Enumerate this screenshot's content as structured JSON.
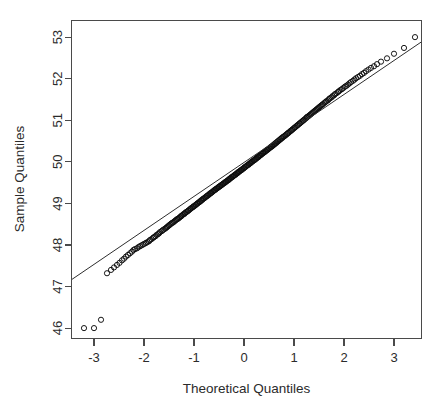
{
  "figure": {
    "title": "",
    "width": 441,
    "height": 409,
    "background": "#ffffff"
  },
  "axis_titles": {
    "x": "Theoretical Quantiles",
    "y": "Sample Quantiles"
  },
  "colors": {
    "point_stroke": "#0d0d0d",
    "line": "#2e2e2e",
    "axis": "#4a4a4a",
    "text": "#2b2b2b"
  },
  "chart_data": {
    "type": "scatter",
    "title": "",
    "xlabel": "Theoretical Quantiles",
    "ylabel": "Sample Quantiles",
    "xlim": [
      -3.45,
      3.55
    ],
    "ylim": [
      45.75,
      53.4
    ],
    "xticks": [
      -3,
      -2,
      -1,
      0,
      1,
      2,
      3
    ],
    "xtick_labels": [
      "-3",
      "-2",
      "-1",
      "0",
      "1",
      "2",
      "3"
    ],
    "yticks": [
      46,
      47,
      48,
      49,
      50,
      51,
      52,
      53
    ],
    "ytick_labels": [
      "46",
      "47",
      "48",
      "49",
      "50",
      "51",
      "52",
      "53"
    ],
    "grid": false,
    "legend": null,
    "marker": "open-circle",
    "marker_size_px": 2.6,
    "reference_line": {
      "description": "qqline through first and third quartiles",
      "slope": 0.8175,
      "intercept": 49.985,
      "x_start": -3.45,
      "x_end": 3.55,
      "y_start": 47.165,
      "y_end": 52.887
    },
    "series": [
      {
        "name": "Sample Quantiles",
        "points": [
          [
            -3.2,
            46.0
          ],
          [
            -3.0,
            46.0
          ],
          [
            -2.86,
            46.2
          ],
          [
            -2.74,
            47.32
          ],
          [
            -2.66,
            47.4
          ],
          [
            -2.6,
            47.46
          ],
          [
            -2.54,
            47.52
          ],
          [
            -2.49,
            47.57
          ],
          [
            -2.44,
            47.63
          ],
          [
            -2.4,
            47.67
          ],
          [
            -2.36,
            47.72
          ],
          [
            -2.32,
            47.76
          ],
          [
            -2.28,
            47.8
          ],
          [
            -2.24,
            47.84
          ],
          [
            -2.21,
            47.88
          ],
          [
            -2.18,
            47.9
          ],
          [
            -2.14,
            47.92
          ],
          [
            -2.11,
            47.95
          ],
          [
            -2.08,
            47.97
          ],
          [
            -2.05,
            47.99
          ],
          [
            -2.02,
            48.01
          ],
          [
            -1.99,
            48.03
          ],
          [
            -1.96,
            48.05
          ],
          [
            -1.93,
            48.07
          ],
          [
            -1.9,
            48.09
          ],
          [
            -1.88,
            48.12
          ],
          [
            -1.85,
            48.14
          ],
          [
            -1.82,
            48.17
          ],
          [
            -1.8,
            48.19
          ],
          [
            -1.77,
            48.21
          ],
          [
            -1.75,
            48.24
          ],
          [
            -1.72,
            48.26
          ],
          [
            -1.7,
            48.28
          ],
          [
            -1.68,
            48.31
          ],
          [
            -1.65,
            48.33
          ],
          [
            -1.63,
            48.35
          ],
          [
            -1.61,
            48.37
          ],
          [
            -1.58,
            48.39
          ],
          [
            -1.56,
            48.41
          ],
          [
            -1.54,
            48.43
          ],
          [
            -1.52,
            48.45
          ],
          [
            -1.5,
            48.47
          ],
          [
            -1.48,
            48.49
          ],
          [
            -1.46,
            48.51
          ],
          [
            -1.44,
            48.53
          ],
          [
            -1.42,
            48.54
          ],
          [
            -1.4,
            48.56
          ],
          [
            -1.38,
            48.58
          ],
          [
            -1.36,
            48.6
          ],
          [
            -1.34,
            48.62
          ],
          [
            -1.32,
            48.63
          ],
          [
            -1.3,
            48.65
          ],
          [
            -1.28,
            48.67
          ],
          [
            -1.26,
            48.69
          ],
          [
            -1.25,
            48.7
          ],
          [
            -1.23,
            48.72
          ],
          [
            -1.21,
            48.74
          ],
          [
            -1.19,
            48.75
          ],
          [
            -1.18,
            48.77
          ],
          [
            -1.16,
            48.79
          ],
          [
            -1.14,
            48.8
          ],
          [
            -1.12,
            48.82
          ],
          [
            -1.11,
            48.83
          ],
          [
            -1.09,
            48.85
          ],
          [
            -1.07,
            48.87
          ],
          [
            -1.06,
            48.88
          ],
          [
            -1.04,
            48.9
          ],
          [
            -1.02,
            48.91
          ],
          [
            -1.01,
            48.93
          ],
          [
            -0.99,
            48.94
          ],
          [
            -0.97,
            48.96
          ],
          [
            -0.96,
            48.97
          ],
          [
            -0.94,
            48.99
          ],
          [
            -0.93,
            49.0
          ],
          [
            -0.91,
            49.02
          ],
          [
            -0.89,
            49.03
          ],
          [
            -0.88,
            49.05
          ],
          [
            -0.86,
            49.06
          ],
          [
            -0.85,
            49.08
          ],
          [
            -0.83,
            49.09
          ],
          [
            -0.82,
            49.11
          ],
          [
            -0.8,
            49.12
          ],
          [
            -0.78,
            49.14
          ],
          [
            -0.77,
            49.15
          ],
          [
            -0.75,
            49.17
          ],
          [
            -0.74,
            49.18
          ],
          [
            -0.72,
            49.19
          ],
          [
            -0.71,
            49.21
          ],
          [
            -0.69,
            49.22
          ],
          [
            -0.68,
            49.24
          ],
          [
            -0.66,
            49.25
          ],
          [
            -0.65,
            49.26
          ],
          [
            -0.63,
            49.28
          ],
          [
            -0.62,
            49.29
          ],
          [
            -0.6,
            49.31
          ],
          [
            -0.59,
            49.32
          ],
          [
            -0.57,
            49.33
          ],
          [
            -0.56,
            49.35
          ],
          [
            -0.54,
            49.36
          ],
          [
            -0.53,
            49.37
          ],
          [
            -0.51,
            49.39
          ],
          [
            -0.5,
            49.4
          ],
          [
            -0.48,
            49.41
          ],
          [
            -0.47,
            49.43
          ],
          [
            -0.45,
            49.44
          ],
          [
            -0.44,
            49.45
          ],
          [
            -0.42,
            49.47
          ],
          [
            -0.41,
            49.48
          ],
          [
            -0.39,
            49.49
          ],
          [
            -0.38,
            49.51
          ],
          [
            -0.36,
            49.52
          ],
          [
            -0.35,
            49.53
          ],
          [
            -0.33,
            49.55
          ],
          [
            -0.32,
            49.56
          ],
          [
            -0.3,
            49.57
          ],
          [
            -0.29,
            49.59
          ],
          [
            -0.28,
            49.6
          ],
          [
            -0.26,
            49.61
          ],
          [
            -0.25,
            49.63
          ],
          [
            -0.23,
            49.64
          ],
          [
            -0.22,
            49.65
          ],
          [
            -0.2,
            49.67
          ],
          [
            -0.19,
            49.68
          ],
          [
            -0.17,
            49.69
          ],
          [
            -0.16,
            49.71
          ],
          [
            -0.14,
            49.72
          ],
          [
            -0.13,
            49.73
          ],
          [
            -0.12,
            49.75
          ],
          [
            -0.1,
            49.76
          ],
          [
            -0.09,
            49.77
          ],
          [
            -0.07,
            49.79
          ],
          [
            -0.06,
            49.8
          ],
          [
            -0.04,
            49.81
          ],
          [
            -0.03,
            49.83
          ],
          [
            -0.01,
            49.84
          ],
          [
            0.0,
            49.85
          ],
          [
            0.01,
            49.87
          ],
          [
            0.03,
            49.88
          ],
          [
            0.04,
            49.89
          ],
          [
            0.06,
            49.91
          ],
          [
            0.07,
            49.92
          ],
          [
            0.09,
            49.93
          ],
          [
            0.1,
            49.95
          ],
          [
            0.12,
            49.96
          ],
          [
            0.13,
            49.97
          ],
          [
            0.14,
            49.99
          ],
          [
            0.16,
            50.0
          ],
          [
            0.17,
            50.01
          ],
          [
            0.19,
            50.03
          ],
          [
            0.2,
            50.04
          ],
          [
            0.22,
            50.05
          ],
          [
            0.23,
            50.07
          ],
          [
            0.25,
            50.08
          ],
          [
            0.26,
            50.1
          ],
          [
            0.28,
            50.11
          ],
          [
            0.29,
            50.12
          ],
          [
            0.3,
            50.14
          ],
          [
            0.32,
            50.15
          ],
          [
            0.33,
            50.16
          ],
          [
            0.35,
            50.18
          ],
          [
            0.36,
            50.19
          ],
          [
            0.38,
            50.21
          ],
          [
            0.39,
            50.22
          ],
          [
            0.41,
            50.23
          ],
          [
            0.42,
            50.25
          ],
          [
            0.44,
            50.26
          ],
          [
            0.45,
            50.28
          ],
          [
            0.47,
            50.29
          ],
          [
            0.48,
            50.3
          ],
          [
            0.5,
            50.32
          ],
          [
            0.51,
            50.33
          ],
          [
            0.53,
            50.35
          ],
          [
            0.54,
            50.36
          ],
          [
            0.56,
            50.37
          ],
          [
            0.57,
            50.39
          ],
          [
            0.59,
            50.4
          ],
          [
            0.6,
            50.42
          ],
          [
            0.62,
            50.43
          ],
          [
            0.63,
            50.45
          ],
          [
            0.65,
            50.46
          ],
          [
            0.66,
            50.48
          ],
          [
            0.68,
            50.49
          ],
          [
            0.69,
            50.51
          ],
          [
            0.71,
            50.52
          ],
          [
            0.72,
            50.54
          ],
          [
            0.74,
            50.55
          ],
          [
            0.75,
            50.57
          ],
          [
            0.77,
            50.58
          ],
          [
            0.78,
            50.6
          ],
          [
            0.8,
            50.61
          ],
          [
            0.82,
            50.63
          ],
          [
            0.83,
            50.64
          ],
          [
            0.85,
            50.66
          ],
          [
            0.86,
            50.67
          ],
          [
            0.88,
            50.69
          ],
          [
            0.89,
            50.7
          ],
          [
            0.91,
            50.72
          ],
          [
            0.93,
            50.74
          ],
          [
            0.94,
            50.75
          ],
          [
            0.96,
            50.77
          ],
          [
            0.97,
            50.78
          ],
          [
            0.99,
            50.8
          ],
          [
            1.01,
            50.82
          ],
          [
            1.02,
            50.83
          ],
          [
            1.04,
            50.85
          ],
          [
            1.06,
            50.87
          ],
          [
            1.07,
            50.88
          ],
          [
            1.09,
            50.9
          ],
          [
            1.11,
            50.92
          ],
          [
            1.12,
            50.93
          ],
          [
            1.14,
            50.95
          ],
          [
            1.16,
            50.97
          ],
          [
            1.18,
            50.99
          ],
          [
            1.19,
            51.0
          ],
          [
            1.21,
            51.02
          ],
          [
            1.23,
            51.04
          ],
          [
            1.25,
            51.06
          ],
          [
            1.26,
            51.08
          ],
          [
            1.28,
            51.09
          ],
          [
            1.3,
            51.11
          ],
          [
            1.32,
            51.13
          ],
          [
            1.34,
            51.15
          ],
          [
            1.36,
            51.17
          ],
          [
            1.38,
            51.19
          ],
          [
            1.4,
            51.21
          ],
          [
            1.42,
            51.23
          ],
          [
            1.44,
            51.25
          ],
          [
            1.46,
            51.27
          ],
          [
            1.48,
            51.29
          ],
          [
            1.5,
            51.31
          ],
          [
            1.52,
            51.33
          ],
          [
            1.54,
            51.35
          ],
          [
            1.56,
            51.37
          ],
          [
            1.58,
            51.39
          ],
          [
            1.61,
            51.42
          ],
          [
            1.63,
            51.44
          ],
          [
            1.65,
            51.46
          ],
          [
            1.68,
            51.48
          ],
          [
            1.7,
            51.51
          ],
          [
            1.72,
            51.53
          ],
          [
            1.75,
            51.55
          ],
          [
            1.77,
            51.58
          ],
          [
            1.8,
            51.6
          ],
          [
            1.82,
            51.63
          ],
          [
            1.85,
            51.65
          ],
          [
            1.88,
            51.68
          ],
          [
            1.9,
            51.7
          ],
          [
            1.93,
            51.73
          ],
          [
            1.96,
            51.75
          ],
          [
            1.99,
            51.78
          ],
          [
            2.02,
            51.81
          ],
          [
            2.05,
            51.83
          ],
          [
            2.08,
            51.86
          ],
          [
            2.11,
            51.89
          ],
          [
            2.14,
            51.92
          ],
          [
            2.18,
            51.95
          ],
          [
            2.21,
            51.98
          ],
          [
            2.24,
            52.01
          ],
          [
            2.28,
            52.04
          ],
          [
            2.32,
            52.07
          ],
          [
            2.36,
            52.11
          ],
          [
            2.4,
            52.14
          ],
          [
            2.44,
            52.18
          ],
          [
            2.49,
            52.22
          ],
          [
            2.54,
            52.26
          ],
          [
            2.6,
            52.3
          ],
          [
            2.66,
            52.35
          ],
          [
            2.74,
            52.41
          ],
          [
            2.86,
            52.49
          ],
          [
            3.0,
            52.6
          ],
          [
            3.2,
            52.74
          ],
          [
            3.42,
            53.0
          ]
        ]
      }
    ]
  }
}
